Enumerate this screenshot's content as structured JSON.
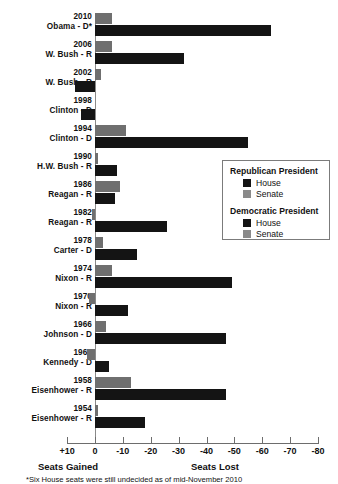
{
  "chart_data": {
    "type": "bar",
    "title": "",
    "orientation": "horizontal",
    "xlabel": "",
    "ylabel": "",
    "xlim": [
      10,
      -80
    ],
    "axis_ticks": [
      10,
      0,
      -10,
      -20,
      -30,
      -40,
      -50,
      -60,
      -70,
      -80
    ],
    "axis_tick_labels": [
      "+10",
      "0",
      "-10",
      "-20",
      "-30",
      "-40",
      "-50",
      "-60",
      "-70",
      "-80"
    ],
    "axis_caption_left": "Seats Gained",
    "axis_caption_right": "Seats Lost",
    "grid": false,
    "legend_position": "middle-right",
    "footnote": "*Six House seats were still undecided as of mid-November 2010",
    "categories": [
      "2010 Obama - D*",
      "2006 W. Bush - R",
      "2002 W. Bush - R",
      "1998 Clinton - D",
      "1994 Clinton - D",
      "1990 H.W. Bush - R",
      "1986 Reagan - R",
      "1982 Reagan - R",
      "1978 Carter - D",
      "1974 Nixon - R",
      "1970 Nixon - R",
      "1966 Johnson - D",
      "1962 Kennedy - D",
      "1958 Eisenhower - R",
      "1954 Eisenhower - R"
    ],
    "series": [
      {
        "name": "House",
        "color": "#141414",
        "values": [
          -63,
          -32,
          7,
          5,
          -55,
          -8,
          -7,
          -26,
          -15,
          -49,
          -12,
          -47,
          -5,
          -47,
          -18
        ]
      },
      {
        "name": "Senate",
        "color": "#6f6f6f",
        "values": [
          -6,
          -6,
          -2,
          0,
          -11,
          -1,
          -9,
          1,
          -3,
          -6,
          2,
          -4,
          3,
          -13,
          -1
        ]
      }
    ]
  },
  "rows": [
    {
      "year": "2010",
      "president": "Obama - D*",
      "party": "D",
      "house": -63,
      "senate": -6
    },
    {
      "year": "2006",
      "president": "W. Bush - R",
      "party": "R",
      "house": -32,
      "senate": -6
    },
    {
      "year": "2002",
      "president": "W. Bush - R",
      "party": "R",
      "house": 7,
      "senate": -2
    },
    {
      "year": "1998",
      "president": "Clinton - D",
      "party": "D",
      "house": 5,
      "senate": 0
    },
    {
      "year": "1994",
      "president": "Clinton - D",
      "party": "D",
      "house": -55,
      "senate": -11
    },
    {
      "year": "1990",
      "president": "H.W. Bush - R",
      "party": "R",
      "house": -8,
      "senate": -1
    },
    {
      "year": "1986",
      "president": "Reagan - R",
      "party": "R",
      "house": -7,
      "senate": -9
    },
    {
      "year": "1982",
      "president": "Reagan - R",
      "party": "R",
      "house": -26,
      "senate": 1
    },
    {
      "year": "1978",
      "president": "Carter - D",
      "party": "D",
      "house": -15,
      "senate": -3
    },
    {
      "year": "1974",
      "president": "Nixon - R",
      "party": "R",
      "house": -49,
      "senate": -6
    },
    {
      "year": "1970",
      "president": "Nixon - R",
      "party": "R",
      "house": -12,
      "senate": 2
    },
    {
      "year": "1966",
      "president": "Johnson - D",
      "party": "D",
      "house": -47,
      "senate": -4
    },
    {
      "year": "1962",
      "president": "Kennedy - D",
      "party": "D",
      "house": -5,
      "senate": 3
    },
    {
      "year": "1958",
      "president": "Eisenhower - R",
      "party": "R",
      "house": -47,
      "senate": -13
    },
    {
      "year": "1954",
      "president": "Eisenhower - R",
      "party": "R",
      "house": -18,
      "senate": -1
    }
  ],
  "legend": {
    "republican_title": "Republican President",
    "democratic_title": "Democratic President",
    "republican_house": "House",
    "republican_senate": "Senate",
    "democratic_house": "House",
    "democratic_senate": "Senate"
  },
  "axis": {
    "caption_left": "Seats Gained",
    "caption_right": "Seats Lost",
    "labels": [
      "+10",
      "0",
      "-10",
      "-20",
      "-30",
      "-40",
      "-50",
      "-60",
      "-70",
      "-80"
    ]
  },
  "footnote": "*Six House seats were still undecided as of mid-November 2010",
  "colors": {
    "house": "#141414",
    "senate": "#6f6f6f",
    "axis": "#6d6d6d"
  }
}
